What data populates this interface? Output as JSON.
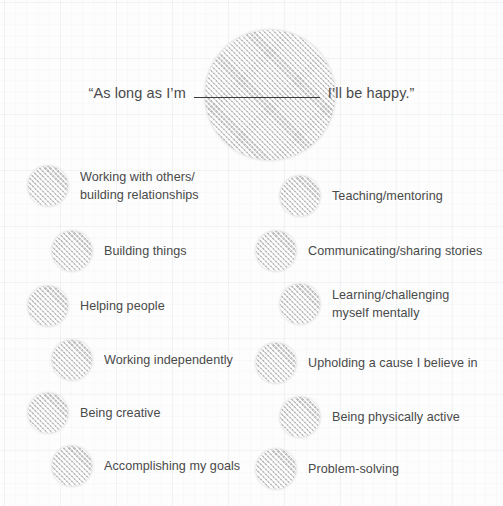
{
  "header": {
    "quote_prefix": "“As long as I’m",
    "quote_blank": "",
    "quote_suffix": "I’ll be happy.”"
  },
  "colors": {
    "text": "#4a4a4a",
    "circle_fill": "#e2e2e2",
    "blank_line": "#3b3b3b",
    "paper": "#fdfdfd"
  },
  "columns": {
    "left": {
      "items": [
        {
          "label": "Working with others/\nbuilding relationships"
        },
        {
          "label": "Building things"
        },
        {
          "label": "Helping people"
        },
        {
          "label": "Working independently"
        },
        {
          "label": "Being creative"
        },
        {
          "label": "Accomplishing my goals"
        }
      ]
    },
    "right": {
      "items": [
        {
          "label": "Teaching/mentoring"
        },
        {
          "label": "Communicating/sharing stories"
        },
        {
          "label": "Learning/challenging\nmyself mentally"
        },
        {
          "label": "Upholding a cause I believe in"
        },
        {
          "label": "Being physically active"
        },
        {
          "label": "Problem-solving"
        }
      ]
    }
  }
}
